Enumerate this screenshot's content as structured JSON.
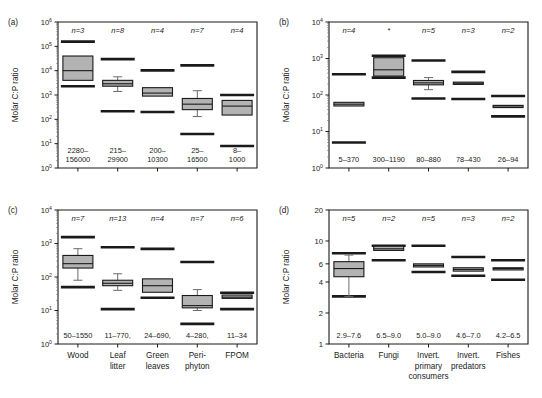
{
  "figure": {
    "background": "#ffffff",
    "box_fill": "#b3b3b3",
    "line_color": "#1a1a1a",
    "whisker_color": "#6b6b6b"
  },
  "chart_data": [
    {
      "type": "box",
      "panel": "a",
      "panel_label": "(a)",
      "title": "",
      "xlabel": "",
      "ylabel": "Molar C:P ratio",
      "yscale": "log",
      "ylim": [
        1,
        1000000
      ],
      "ytick_values": [
        1,
        10,
        100,
        1000,
        10000,
        100000,
        1000000
      ],
      "ytick_labels": [
        "10^0",
        "10^1",
        "10^2",
        "10^3",
        "10^4",
        "10^5",
        "10^6"
      ],
      "grid": false,
      "legend": "none",
      "categories": [
        "Wood",
        "Leaf litter",
        "Green leaves",
        "Periphyton",
        "FPOM"
      ],
      "show_xticklabels": false,
      "boxes": [
        {
          "n_label": "n=3",
          "range_label": [
            "2280–",
            "156000"
          ],
          "min": 2280,
          "q1": 4000,
          "median": 10000,
          "q3": 40000,
          "max": 156000,
          "whiskers": false
        },
        {
          "n_label": "n=8",
          "range_label": [
            "215–",
            "29900"
          ],
          "min": 215,
          "q1": 2300,
          "median": 2900,
          "q3": 4000,
          "max": 29900,
          "whiskers": true,
          "whisk_low": 1400,
          "whisk_high": 5600
        },
        {
          "n_label": "n=4",
          "range_label": [
            "200–",
            "10300"
          ],
          "min": 200,
          "q1": 900,
          "median": 1200,
          "q3": 2000,
          "max": 10300,
          "whiskers": false
        },
        {
          "n_label": "n=7",
          "range_label": [
            "25–",
            "16500"
          ],
          "min": 25,
          "q1": 250,
          "median": 420,
          "q3": 720,
          "max": 16500,
          "whiskers": true,
          "whisk_low": 130,
          "whisk_high": 1500
        },
        {
          "n_label": "n=4",
          "range_label": [
            "8–",
            "1000"
          ],
          "min": 8,
          "q1": 150,
          "median": 350,
          "q3": 600,
          "max": 1000,
          "whiskers": false
        }
      ]
    },
    {
      "type": "box",
      "panel": "b",
      "panel_label": "(b)",
      "title": "",
      "xlabel": "",
      "ylabel": "Molar C:P ratio",
      "yscale": "log",
      "ylim": [
        1,
        10000
      ],
      "ytick_values": [
        1,
        10,
        100,
        1000,
        10000
      ],
      "ytick_labels": [
        "10^0",
        "10^1",
        "10^2",
        "10^3",
        "10^4"
      ],
      "grid": false,
      "legend": "none",
      "categories": [
        "Bacteria",
        "Fungi",
        "Invert. primary consumers",
        "Invert. predators",
        "Fishes"
      ],
      "show_xticklabels": false,
      "boxes": [
        {
          "n_label": "n=4",
          "range_label": [
            "5–370"
          ],
          "min": 5,
          "q1": 50,
          "median": 56,
          "q3": 63,
          "max": 370,
          "whiskers": false
        },
        {
          "n_label": "*",
          "range_label": [
            "300–1190"
          ],
          "min": 300,
          "q1": 330,
          "median": 490,
          "q3": 1050,
          "max": 1190,
          "whiskers": false
        },
        {
          "n_label": "n=5",
          "range_label": [
            "80–880"
          ],
          "min": 80,
          "q1": 190,
          "median": 215,
          "q3": 250,
          "max": 880,
          "whiskers": true,
          "whisk_low": 140,
          "whisk_high": 300
        },
        {
          "n_label": "n=3",
          "range_label": [
            "78–430"
          ],
          "min": 78,
          "q1": 195,
          "median": 210,
          "q3": 225,
          "max": 430,
          "whiskers": false
        },
        {
          "n_label": "n=2",
          "range_label": [
            "26–94"
          ],
          "min": 26,
          "q1": 48,
          "median": 50,
          "q3": 52,
          "max": 94,
          "whiskers": false
        }
      ]
    },
    {
      "type": "box",
      "panel": "c",
      "panel_label": "(c)",
      "title": "",
      "xlabel": "",
      "ylabel": "Molar C:P ratio",
      "yscale": "log",
      "ylim": [
        1,
        10000
      ],
      "ytick_values": [
        1,
        10,
        100,
        1000,
        10000
      ],
      "ytick_labels": [
        "10^0",
        "10^1",
        "10^2",
        "10^3",
        "10^4"
      ],
      "grid": false,
      "legend": "none",
      "categories": [
        "Wood",
        "Leaf litter",
        "Green leaves",
        "Peri- phyton",
        "FPOM"
      ],
      "show_xticklabels": true,
      "boxes": [
        {
          "n_label": "n=7",
          "range_label": [
            "50–1550"
          ],
          "min": 50,
          "q1": 185,
          "median": 250,
          "q3": 440,
          "max": 1550,
          "whiskers": true,
          "whisk_low": 80,
          "whisk_high": 700
        },
        {
          "n_label": "n=13",
          "range_label": [
            "11–770,"
          ],
          "min": 11,
          "q1": 55,
          "median": 65,
          "q3": 80,
          "max": 770,
          "whiskers": true,
          "whisk_low": 40,
          "whisk_high": 125
        },
        {
          "n_label": "n=4",
          "range_label": [
            "24–690,"
          ],
          "min": 24,
          "q1": 35,
          "median": 55,
          "q3": 88,
          "max": 690,
          "whiskers": false
        },
        {
          "n_label": "n=7",
          "range_label": [
            "4–280,"
          ],
          "min": 4,
          "q1": 12,
          "median": 14,
          "q3": 28,
          "max": 280,
          "whiskers": true,
          "whisk_low": 10,
          "whisk_high": 42
        },
        {
          "n_label": "n=6",
          "range_label": [
            "11–34"
          ],
          "min": 11,
          "q1": 23,
          "median": 25,
          "q3": 29,
          "max": 34,
          "whiskers": false
        }
      ]
    },
    {
      "type": "box",
      "panel": "d",
      "panel_label": "(d)",
      "title": "",
      "xlabel": "",
      "ylabel": "Molar C:P ratio",
      "yscale": "log",
      "ylim": [
        1,
        20
      ],
      "ytick_values": [
        1,
        2,
        4,
        6,
        10,
        20
      ],
      "ytick_labels": [
        "1",
        "2",
        "4",
        "6",
        "10",
        "20"
      ],
      "grid": false,
      "legend": "none",
      "categories": [
        "Bacteria",
        "Fungi",
        "Invert. primary consumers",
        "Invert. predators",
        "Fishes"
      ],
      "show_xticklabels": true,
      "boxes": [
        {
          "n_label": "n=5",
          "range_label": [
            "2.9–7.6"
          ],
          "min": 2.9,
          "q1": 4.5,
          "median": 5.4,
          "q3": 6.3,
          "max": 7.6,
          "whiskers": true,
          "whisk_low": 2.9,
          "whisk_high": 7.3
        },
        {
          "n_label": "n=2",
          "range_label": [
            "6.5–9.0"
          ],
          "min": 6.5,
          "q1": 8.1,
          "median": 8.4,
          "q3": 8.9,
          "max": 9.0,
          "whiskers": false
        },
        {
          "n_label": "n=5",
          "range_label": [
            "5.0–9.0"
          ],
          "min": 5.0,
          "q1": 5.6,
          "median": 5.8,
          "q3": 6.0,
          "max": 9.0,
          "whiskers": false
        },
        {
          "n_label": "n=3",
          "range_label": [
            "4.6–7.0"
          ],
          "min": 4.6,
          "q1": 5.1,
          "median": 5.3,
          "q3": 5.5,
          "max": 7.0,
          "whiskers": false
        },
        {
          "n_label": "n=2",
          "range_label": [
            "4.2–6.5"
          ],
          "min": 4.2,
          "q1": 5.3,
          "median": 5.4,
          "q3": 5.5,
          "max": 6.5,
          "whiskers": false
        }
      ]
    }
  ]
}
